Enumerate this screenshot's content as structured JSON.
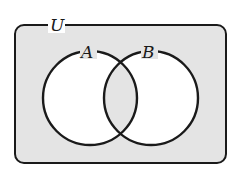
{
  "diagram": {
    "type": "venn",
    "universe_label": "U",
    "sets": [
      {
        "label": "A",
        "cx": 90,
        "cy": 98,
        "r": 47
      },
      {
        "label": "B",
        "cx": 151,
        "cy": 98,
        "r": 47
      }
    ],
    "shaded_regions": [
      "outside A∪B",
      "A∩B"
    ],
    "colors": {
      "shade": "#e4e4e4",
      "stroke": "#1a1a1a",
      "unshaded": "#ffffff"
    }
  }
}
